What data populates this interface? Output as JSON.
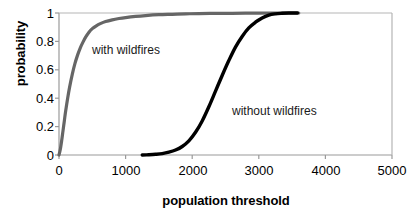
{
  "chart_data": {
    "type": "line",
    "title": "",
    "xlabel": "population threshold",
    "ylabel": "probability",
    "xlim": [
      0,
      5000
    ],
    "ylim": [
      0,
      1
    ],
    "xticks": [
      "0",
      "1000",
      "2000",
      "3000",
      "4000",
      "5000"
    ],
    "xtick_values": [
      0,
      1000,
      2000,
      3000,
      4000,
      5000
    ],
    "yticks": [
      "0",
      "0.2",
      "0.4",
      "0.6",
      "0.8",
      "1"
    ],
    "ytick_values": [
      0,
      0.2,
      0.4,
      0.6,
      0.8,
      1
    ],
    "grid": false,
    "legend": "annotations-inline",
    "series": [
      {
        "name": "with wildfires",
        "color": "#666666",
        "annotation": "with wildfires",
        "x": [
          0,
          20,
          40,
          60,
          80,
          100,
          130,
          160,
          200,
          240,
          280,
          320,
          360,
          400,
          450,
          500,
          560,
          620,
          700,
          800,
          900,
          1000,
          1150,
          1300,
          1500,
          1700,
          1900,
          2100,
          2350,
          2600,
          2900,
          3200,
          3450,
          3600
        ],
        "y": [
          0.0,
          0.04,
          0.1,
          0.17,
          0.24,
          0.31,
          0.4,
          0.48,
          0.57,
          0.645,
          0.705,
          0.755,
          0.795,
          0.83,
          0.865,
          0.89,
          0.91,
          0.925,
          0.94,
          0.952,
          0.961,
          0.968,
          0.976,
          0.982,
          0.988,
          0.991,
          0.994,
          0.996,
          0.997,
          0.998,
          0.999,
          1.0,
          1.0,
          1.0
        ]
      },
      {
        "name": "without wildfires",
        "color": "#000000",
        "annotation": "without wildfires",
        "x": [
          1250,
          1350,
          1450,
          1550,
          1650,
          1750,
          1850,
          1950,
          2050,
          2150,
          2250,
          2350,
          2450,
          2550,
          2650,
          2750,
          2850,
          2950,
          3050,
          3150,
          3250,
          3350,
          3450,
          3580
        ],
        "y": [
          0.0,
          0.002,
          0.005,
          0.01,
          0.02,
          0.035,
          0.06,
          0.1,
          0.16,
          0.24,
          0.34,
          0.45,
          0.56,
          0.665,
          0.76,
          0.835,
          0.895,
          0.935,
          0.965,
          0.985,
          0.994,
          0.998,
          1.0,
          1.0
        ]
      }
    ]
  },
  "annotations": {
    "with_wildfires": "with wildfires",
    "without_wildfires": "without wildfires"
  },
  "colors": {
    "series_gray": "#666666",
    "series_black": "#000000",
    "axis": "#9a9a9a",
    "text": "#000000"
  }
}
